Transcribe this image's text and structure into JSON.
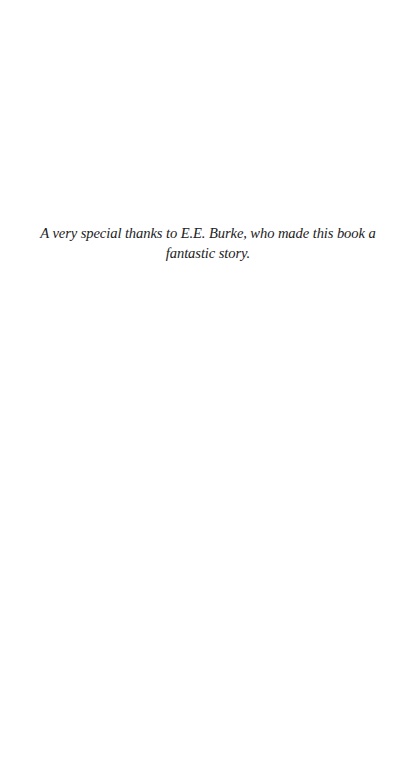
{
  "page": {
    "type": "dedication",
    "background": "#ffffff",
    "text_color": "#222222"
  },
  "dedication": {
    "text": "A very special thanks to E.E. Burke, who made this book a fantastic story."
  }
}
